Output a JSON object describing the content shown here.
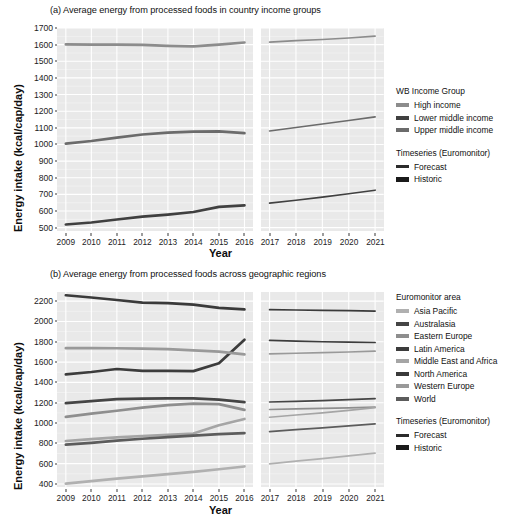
{
  "figure": {
    "xlabel": "Year",
    "ylabel": "Energy intake (kcal/cap/day)"
  },
  "chart_data": [
    {
      "type": "line",
      "title": "(a) Average energy from processed foods in country income groups",
      "xlabel": "Year",
      "ylabel": "Energy intake (kcal/cap/day)",
      "x": [
        2009,
        2010,
        2011,
        2012,
        2013,
        2014,
        2015,
        2016,
        2017,
        2018,
        2019,
        2020,
        2021
      ],
      "xlim": [
        2009,
        2021
      ],
      "ylim": [
        480,
        1700
      ],
      "yticks": [
        500,
        600,
        700,
        800,
        900,
        1000,
        1100,
        1200,
        1300,
        1400,
        1500,
        1600,
        1700
      ],
      "grid": true,
      "legend_position": "right",
      "facets": [
        {
          "name": "Historic",
          "years": [
            2009,
            2010,
            2011,
            2012,
            2013,
            2014,
            2015,
            2016
          ]
        },
        {
          "name": "Forecast",
          "years": [
            2017,
            2018,
            2019,
            2020,
            2021
          ]
        }
      ],
      "series": [
        {
          "name": "High income",
          "color": "#8c8c8c",
          "historic": [
            1601,
            1600,
            1600,
            1598,
            1593,
            1589,
            1600,
            1613
          ],
          "forecast": [
            1615,
            1624,
            1631,
            1640,
            1651
          ]
        },
        {
          "name": "Lower middle income",
          "color": "#404040",
          "historic": [
            519,
            531,
            549,
            566,
            579,
            594,
            625,
            634
          ],
          "forecast": [
            647,
            665,
            684,
            704,
            725
          ]
        },
        {
          "name": "Upper middle income",
          "color": "#6b6b6b",
          "historic": [
            1005,
            1021,
            1041,
            1060,
            1071,
            1077,
            1079,
            1068
          ],
          "forecast": [
            1081,
            1102,
            1123,
            1144,
            1166
          ]
        }
      ]
    },
    {
      "type": "line",
      "title": "(b) Average energy from processed foods across geographic regions",
      "xlabel": "Year",
      "ylabel": "Energy intake (kcal/cap/day)",
      "x": [
        2009,
        2010,
        2011,
        2012,
        2013,
        2014,
        2015,
        2016,
        2017,
        2018,
        2019,
        2020,
        2021
      ],
      "xlim": [
        2009,
        2021
      ],
      "ylim": [
        370,
        2290
      ],
      "yticks": [
        400,
        600,
        800,
        1000,
        1200,
        1400,
        1600,
        1800,
        2000,
        2200
      ],
      "grid": true,
      "legend_position": "right",
      "facets": [
        {
          "name": "Historic",
          "years": [
            2009,
            2010,
            2011,
            2012,
            2013,
            2014,
            2015,
            2016
          ]
        },
        {
          "name": "Forecast",
          "years": [
            2017,
            2018,
            2019,
            2020,
            2021
          ]
        }
      ],
      "series": [
        {
          "name": "Asia Pacific",
          "color": "#b0b0b0",
          "historic": [
            404,
            428,
            452,
            475,
            497,
            519,
            545,
            572
          ],
          "forecast": [
            597,
            624,
            650,
            676,
            703
          ]
        },
        {
          "name": "Australasia",
          "color": "#454545",
          "historic": [
            1196,
            1216,
            1236,
            1240,
            1243,
            1242,
            1231,
            1205
          ],
          "forecast": [
            1207,
            1214,
            1221,
            1230,
            1240
          ]
        },
        {
          "name": "Eastern Europe",
          "color": "#8e8e8e",
          "historic": [
            1061,
            1092,
            1121,
            1152,
            1176,
            1190,
            1186,
            1129
          ],
          "forecast": [
            1133,
            1139,
            1144,
            1150,
            1157
          ]
        },
        {
          "name": "Latin America",
          "color": "#3c3c3c",
          "historic": [
            1479,
            1502,
            1532,
            1513,
            1513,
            1511,
            1588,
            1820
          ],
          "forecast": [
            1814,
            1806,
            1800,
            1796,
            1793
          ]
        },
        {
          "name": "Middle East and Africa",
          "color": "#a5a5a5",
          "historic": [
            823,
            842,
            858,
            872,
            884,
            896,
            978,
            1040
          ],
          "forecast": [
            1057,
            1079,
            1100,
            1125,
            1152
          ]
        },
        {
          "name": "North America",
          "color": "#3a3a3a",
          "historic": [
            2258,
            2236,
            2211,
            2186,
            2181,
            2165,
            2133,
            2118
          ],
          "forecast": [
            2116,
            2113,
            2110,
            2106,
            2102
          ]
        },
        {
          "name": "Western Europe",
          "color": "#999999",
          "historic": [
            1737,
            1737,
            1736,
            1733,
            1727,
            1716,
            1703,
            1676
          ],
          "forecast": [
            1680,
            1687,
            1693,
            1699,
            1707
          ]
        },
        {
          "name": "World",
          "color": "#5c5c5c",
          "historic": [
            787,
            805,
            827,
            845,
            861,
            875,
            890,
            901
          ],
          "forecast": [
            915,
            934,
            952,
            972,
            992
          ]
        }
      ]
    }
  ],
  "legend_a": {
    "title": "WB Income Group",
    "items": [
      {
        "label": "High income",
        "color": "#8c8c8c"
      },
      {
        "label": "Lower middle income",
        "color": "#404040"
      },
      {
        "label": "Upper middle income",
        "color": "#6b6b6b"
      }
    ],
    "timeseries_title": "Timeseries (Euromonitor)",
    "timeseries": [
      {
        "label": "Forecast",
        "color": "#2b2b2b",
        "weight": "thin"
      },
      {
        "label": "Historic",
        "color": "#1a1a1a",
        "weight": "thick"
      }
    ]
  },
  "legend_b": {
    "title": "Euromonitor area",
    "items": [
      {
        "label": "Asia Pacific",
        "color": "#b0b0b0"
      },
      {
        "label": "Australasia",
        "color": "#454545"
      },
      {
        "label": "Eastern Europe",
        "color": "#8e8e8e"
      },
      {
        "label": "Latin America",
        "color": "#3c3c3c"
      },
      {
        "label": "Middle East and Africa",
        "color": "#a5a5a5"
      },
      {
        "label": "North America",
        "color": "#3a3a3a"
      },
      {
        "label": "Western Europe",
        "color": "#999999"
      },
      {
        "label": "World",
        "color": "#5c5c5c"
      }
    ],
    "timeseries_title": "Timeseries (Euromonitor)",
    "timeseries": [
      {
        "label": "Forecast",
        "color": "#2b2b2b",
        "weight": "thin"
      },
      {
        "label": "Historic",
        "color": "#1a1a1a",
        "weight": "thick"
      }
    ]
  }
}
